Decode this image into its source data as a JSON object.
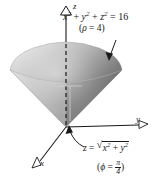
{
  "figure": {
    "background_color": "#ffffff",
    "axes": {
      "z_label": "z",
      "y_label": "y",
      "x_label": "x",
      "origin": [
        66,
        127
      ]
    },
    "labels": {
      "sphere_equation": {
        "var_x": "x",
        "exp_x": "2",
        "plus_1": "+",
        "var_y": "y",
        "exp_y": "2",
        "plus_2": "+",
        "var_z": "z",
        "exp_z": "2",
        "equals": "=",
        "value": "16",
        "plain": "x2 + y2 + z2 = 16"
      },
      "rho_note": {
        "open": "(",
        "symbol": "ρ",
        "equals": "=",
        "value": "4",
        "close": ")",
        "plain": "(ρ = 4)"
      },
      "cone_equation": {
        "var_z": "z",
        "equals": "=",
        "radicand_x": "x",
        "exp_x": "2",
        "plus": "+",
        "radicand_y": "y",
        "exp_y": "2",
        "plain": "z = sqrt(x2 + y2)"
      },
      "phi_note": {
        "open": "(",
        "symbol": "ϕ",
        "equals": "=",
        "numerator": "π",
        "denominator": "4",
        "close": ")",
        "plain": "(ϕ = π/4)"
      }
    },
    "colors": {
      "ink": "#1a1a1a",
      "surface_light": "#e2e2e2",
      "surface_mid": "#b4b4b4",
      "surface_dark": "#7e7e7e",
      "surface_darkest": "#6a6a6a"
    }
  }
}
